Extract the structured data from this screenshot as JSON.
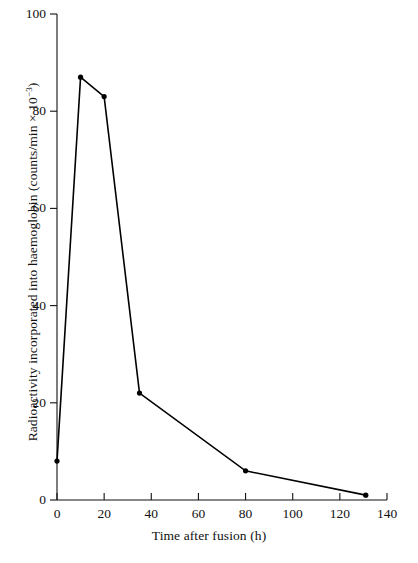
{
  "chart_data": {
    "type": "line",
    "title": "",
    "xlabel": "Time after fusion (h)",
    "ylabel": "Radioactivity incorporated into haemoglobin (counts/min × 10⁻³)",
    "ylabel_prefix": "Radioactivity incorporated into haemoglobin (counts/min × 10",
    "ylabel_exponent": "−3",
    "ylabel_suffix": ")",
    "xlim": [
      0,
      140
    ],
    "ylim": [
      0,
      100
    ],
    "xticks": [
      0,
      20,
      40,
      60,
      80,
      100,
      120,
      140
    ],
    "xtick_labels": [
      "0",
      "20",
      "40",
      "60",
      "80",
      "100",
      "120",
      "140"
    ],
    "yticks": [
      0,
      20,
      40,
      60,
      80,
      100
    ],
    "ytick_labels": [
      "0",
      "20",
      "40",
      "60",
      "80",
      "100"
    ],
    "grid": false,
    "legend": null,
    "marker": "filled-circle",
    "line_color": "#000000",
    "marker_color": "#000000",
    "axis_color": "#000000",
    "background_color": "#ffffff",
    "x": [
      0,
      10,
      20,
      35,
      80,
      131
    ],
    "values": [
      8,
      87,
      83,
      22,
      6,
      1
    ],
    "series": [
      {
        "name": "Radioactivity incorporated into haemoglobin",
        "points": [
          {
            "x": 0,
            "y": 8
          },
          {
            "x": 10,
            "y": 87
          },
          {
            "x": 20,
            "y": 83
          },
          {
            "x": 35,
            "y": 22
          },
          {
            "x": 80,
            "y": 6
          },
          {
            "x": 131,
            "y": 1
          }
        ]
      }
    ]
  }
}
